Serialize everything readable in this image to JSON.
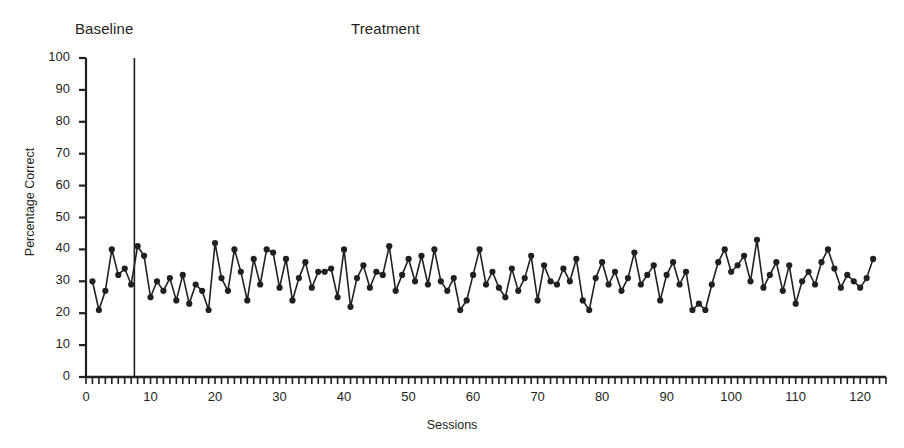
{
  "chart_data": {
    "type": "line",
    "title": "",
    "xlabel": "Sessions",
    "ylabel": "Percentage Correct",
    "xlim": [
      0,
      124
    ],
    "ylim": [
      0,
      100
    ],
    "grid": false,
    "legend": "none",
    "marker": "filled-circle",
    "line_color": "#231f20",
    "yticks": [
      0,
      10,
      20,
      30,
      40,
      50,
      60,
      70,
      80,
      90,
      100
    ],
    "xticks": [
      0,
      10,
      20,
      30,
      40,
      50,
      60,
      70,
      80,
      90,
      100,
      110,
      120
    ],
    "x_minor_tick_interval": 1,
    "annotations": [
      {
        "text": "Baseline",
        "phase_start": 1,
        "phase_end": 7
      },
      {
        "text": "Treatment",
        "phase_start": 8,
        "phase_end": 122
      }
    ],
    "phase_line_x": 7.5,
    "x": [
      1,
      2,
      3,
      4,
      5,
      6,
      7,
      8,
      9,
      10,
      11,
      12,
      13,
      14,
      15,
      16,
      17,
      18,
      19,
      20,
      21,
      22,
      23,
      24,
      25,
      26,
      27,
      28,
      29,
      30,
      31,
      32,
      33,
      34,
      35,
      36,
      37,
      38,
      39,
      40,
      41,
      42,
      43,
      44,
      45,
      46,
      47,
      48,
      49,
      50,
      51,
      52,
      53,
      54,
      55,
      56,
      57,
      58,
      59,
      60,
      61,
      62,
      63,
      64,
      65,
      66,
      67,
      68,
      69,
      70,
      71,
      72,
      73,
      74,
      75,
      76,
      77,
      78,
      79,
      80,
      81,
      82,
      83,
      84,
      85,
      86,
      87,
      88,
      89,
      90,
      91,
      92,
      93,
      94,
      95,
      96,
      97,
      98,
      99,
      100,
      101,
      102,
      103,
      104,
      105,
      106,
      107,
      108,
      109,
      110,
      111,
      112,
      113,
      114,
      115,
      116,
      117,
      118,
      119,
      120,
      121,
      122
    ],
    "values": [
      30,
      21,
      27,
      40,
      32,
      34,
      29,
      41,
      38,
      25,
      30,
      27,
      31,
      24,
      32,
      23,
      29,
      27,
      21,
      42,
      31,
      27,
      40,
      33,
      24,
      37,
      29,
      40,
      39,
      28,
      37,
      24,
      31,
      36,
      28,
      33,
      33,
      34,
      25,
      40,
      22,
      31,
      35,
      28,
      33,
      32,
      41,
      27,
      32,
      37,
      30,
      38,
      29,
      40,
      30,
      27,
      31,
      21,
      24,
      32,
      40,
      29,
      33,
      28,
      25,
      34,
      27,
      31,
      38,
      24,
      35,
      30,
      29,
      34,
      30,
      37,
      24,
      21,
      31,
      36,
      29,
      33,
      27,
      31,
      39,
      29,
      32,
      35,
      24,
      32,
      36,
      29,
      33,
      21,
      23,
      21,
      29,
      36,
      40,
      33,
      35,
      38,
      30,
      43,
      28,
      32,
      36,
      27,
      35,
      23,
      30,
      33,
      29,
      36,
      40,
      34,
      28,
      32,
      30,
      28,
      31,
      37
    ],
    "series_name": "Percentage Correct"
  },
  "labels": {
    "baseline": "Baseline",
    "treatment": "Treatment",
    "y_axis_title": "Percentage Correct",
    "x_axis_title": "Sessions"
  }
}
